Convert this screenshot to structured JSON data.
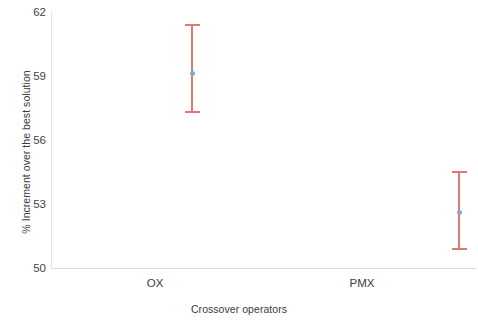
{
  "chart_data": {
    "type": "scatter",
    "title": "",
    "xlabel": "Crossover operators",
    "ylabel": "% Increment over the best solution",
    "categories": [
      "OX",
      "PMX"
    ],
    "yticks": [
      62,
      59,
      56,
      53,
      50
    ],
    "ylim": [
      50,
      62
    ],
    "grid": false,
    "legend": null,
    "error_bar_style": "capped-vertical",
    "series": [
      {
        "name": "% Increment over the best solution",
        "values": [
          59.1,
          52.6
        ],
        "upper": [
          61.4,
          54.5
        ],
        "lower": [
          57.3,
          50.9
        ],
        "marker_color": "#7FA9DC",
        "error_color": "#E0796E"
      }
    ],
    "points": [
      {
        "category": "OX",
        "mean": 59.1,
        "upper": 61.4,
        "lower": 57.3
      },
      {
        "category": "PMX",
        "mean": 52.6,
        "upper": 54.5,
        "lower": 50.9
      }
    ]
  },
  "axes": {
    "y_title": "% Increment over the best solution",
    "x_title": "Crossover operators",
    "y_tick_labels": [
      "62",
      "59",
      "56",
      "53",
      "50"
    ],
    "x_tick_labels": [
      "OX",
      "PMX"
    ]
  },
  "colors": {
    "error_bar": "#E0796E",
    "marker": "#7FA9DC",
    "axis": "#dcdcdc",
    "text": "#3d3d3d",
    "background": "#ffffff"
  }
}
